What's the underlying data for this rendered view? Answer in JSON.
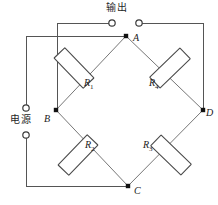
{
  "diagram": {
    "type": "wheatstone-bridge-circuit",
    "background_color": "#ffffff",
    "wire_color": "#555555",
    "diagonal_wire_color": "#777777",
    "node_color": "#111111",
    "resistor_fill": "#ffffff",
    "resistor_stroke": "#4a4a4a"
  },
  "labels": {
    "output": "输出",
    "power_source": "电源"
  },
  "nodes": [
    {
      "id": "A",
      "label": "A",
      "x": 126,
      "y": 36,
      "label_x": 133,
      "label_y": 33
    },
    {
      "id": "B",
      "label": "B",
      "x": 56,
      "y": 110,
      "label_x": 44,
      "label_y": 114
    },
    {
      "id": "C",
      "label": "C",
      "x": 128,
      "y": 186,
      "label_x": 134,
      "label_y": 186
    },
    {
      "id": "D",
      "label": "D",
      "x": 203,
      "y": 110,
      "label_x": 206,
      "label_y": 108
    }
  ],
  "resistors": [
    {
      "id": "R1",
      "name": "R",
      "subscript": "1",
      "between": "A-B",
      "label_x": 84,
      "label_y": 78,
      "cx": 74,
      "cy": 68,
      "angle": 46
    },
    {
      "id": "R4",
      "name": "R",
      "subscript": "4",
      "between": "A-D",
      "label_x": 149,
      "label_y": 78,
      "cx": 170,
      "cy": 68,
      "angle": -44
    },
    {
      "id": "R2",
      "name": "R",
      "subscript": "2",
      "between": "B-C",
      "label_x": 85,
      "label_y": 140,
      "cx": 78,
      "cy": 155,
      "angle": -46
    },
    {
      "id": "R3",
      "name": "R",
      "subscript": "3",
      "between": "C-D",
      "label_x": 143,
      "label_y": 140,
      "cx": 171,
      "cy": 155,
      "angle": 44
    }
  ],
  "terminals": [
    {
      "id": "output-left",
      "belongs_to": "输出",
      "x": 112,
      "y": 23,
      "r": 3.2
    },
    {
      "id": "output-right",
      "belongs_to": "输出",
      "x": 139,
      "y": 23,
      "r": 3.2
    },
    {
      "id": "power-top",
      "belongs_to": "电源",
      "x": 26,
      "y": 108,
      "r": 3.2
    },
    {
      "id": "power-bottom",
      "belongs_to": "电源",
      "x": 26,
      "y": 135,
      "r": 3.2
    }
  ],
  "label_positions": {
    "output_x": 106,
    "output_y": 3,
    "power_x": 10,
    "power_y": 115
  }
}
